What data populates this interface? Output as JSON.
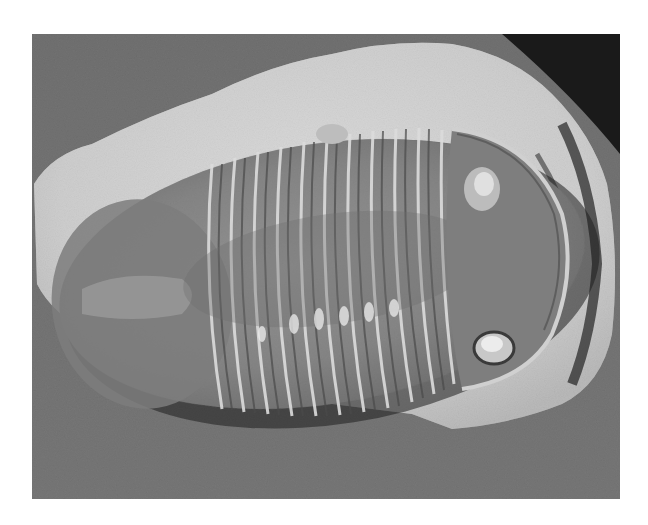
{
  "image": {
    "subject": "trilobite fossil on limestone matrix",
    "alt": "Black and white photograph of a trilobite fossil resting on a pale rock slab against a grey textured background",
    "colors": {
      "background": "#6f6f6f",
      "rock": "#d8d8d8",
      "fossil": "#8a8a8a",
      "shadow": "#1e1e1e",
      "highlight": "#e6e6e6"
    },
    "segments": 13
  }
}
